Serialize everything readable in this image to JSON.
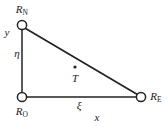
{
  "figure": {
    "type": "geometry-diagram",
    "background_color": "#ffffff",
    "stroke_color": "#222222"
  },
  "nodes": [
    {
      "id": "north",
      "name": "R_N",
      "base": "R",
      "subscript": "N",
      "cx": 22,
      "cy": 25,
      "r": 4.6,
      "label_x": 22,
      "label_y": 10,
      "marker": "open-circle"
    },
    {
      "id": "origin",
      "name": "R_O",
      "base": "R",
      "subscript": "O",
      "cx": 22,
      "cy": 97,
      "r": 4.6,
      "label_x": 22,
      "label_y": 112,
      "marker": "open-circle"
    },
    {
      "id": "east",
      "name": "R_E",
      "base": "R",
      "subscript": "E",
      "cx": 141,
      "cy": 97,
      "r": 4.6,
      "label_x": 156,
      "label_y": 97,
      "marker": "open-circle"
    }
  ],
  "edges": [
    {
      "id": "vertical-leg",
      "from": "north",
      "to": "origin"
    },
    {
      "id": "horizontal-leg",
      "from": "origin",
      "to": "east"
    },
    {
      "id": "hypotenuse",
      "from": "north",
      "to": "east"
    }
  ],
  "point": {
    "id": "T",
    "label": "T",
    "dot_x": 75,
    "dot_y": 67,
    "dot_r": 1.6,
    "label_x": 75,
    "label_y": 78
  },
  "axis_labels": [
    {
      "id": "y-axis",
      "text": "y",
      "x": 7,
      "y": 32
    },
    {
      "id": "x-axis",
      "text": "x",
      "x": 97,
      "y": 117
    }
  ],
  "coordinate_labels": [
    {
      "id": "eta",
      "text": "η",
      "x": 17,
      "y": 53
    },
    {
      "id": "xi",
      "text": "ξ",
      "x": 79,
      "y": 105
    }
  ]
}
